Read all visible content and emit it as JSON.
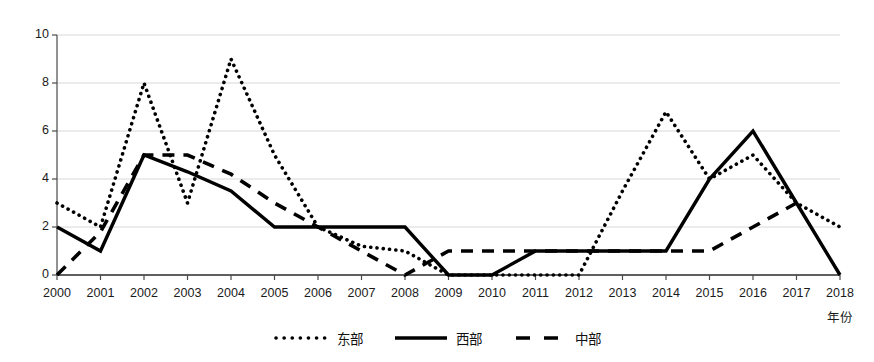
{
  "chart_data": {
    "type": "line",
    "title": "",
    "xlabel": "年份",
    "ylabel": "",
    "grid": true,
    "legend_position": "bottom",
    "ylim": [
      0,
      10
    ],
    "yticks": [
      0,
      2,
      4,
      6,
      8,
      10
    ],
    "categories": [
      "2000",
      "2001",
      "2002",
      "2003",
      "2004",
      "2005",
      "2006",
      "2007",
      "2008",
      "2009",
      "2010",
      "2011",
      "2012",
      "2013",
      "2014",
      "2015",
      "2016",
      "2017",
      "2018"
    ],
    "series": [
      {
        "name": "东部",
        "style": "dotted",
        "color": "#000000",
        "values": [
          3,
          2,
          8,
          3,
          9,
          5,
          2,
          1.2,
          1,
          0,
          0,
          0,
          0,
          3.5,
          6.8,
          4,
          5,
          3,
          2
        ]
      },
      {
        "name": "西部",
        "style": "solid",
        "color": "#000000",
        "values": [
          2,
          1,
          5,
          4.3,
          3.5,
          2,
          2,
          2,
          2,
          0,
          0,
          1,
          1,
          1,
          1,
          4,
          6,
          3,
          0
        ]
      },
      {
        "name": "中部",
        "style": "dashed",
        "color": "#000000",
        "values": [
          0,
          1.8,
          5,
          5,
          4.2,
          3,
          2,
          1,
          0,
          1,
          1,
          1,
          1,
          1,
          1,
          1,
          2,
          3,
          null
        ]
      }
    ]
  },
  "legend": {
    "items": [
      {
        "label": "东部",
        "style": "dotted"
      },
      {
        "label": "西部",
        "style": "solid"
      },
      {
        "label": "中部",
        "style": "dashed"
      }
    ]
  },
  "axes": {
    "x_title": "年份"
  }
}
